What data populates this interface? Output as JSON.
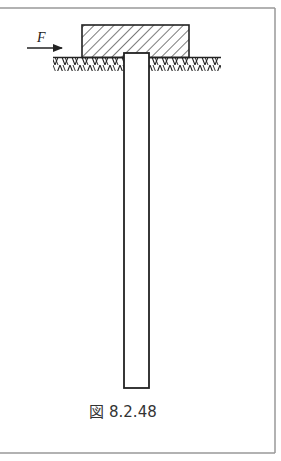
{
  "figure": {
    "caption": "図 8.2.48",
    "force_label": "F",
    "components": [
      {
        "name": "footing-block",
        "fill": "diagonal-hatch",
        "description": "Hatched rectangular cap block resting on ground"
      },
      {
        "name": "ground-surface",
        "fill": "zigzag-hatch",
        "description": "Ground line with soil hatching below"
      },
      {
        "name": "pile-column",
        "fill": "none",
        "description": "Long vertical pile embedded in the ground beneath the block"
      },
      {
        "name": "force-arrow",
        "direction": "right",
        "description": "Horizontal force F acting on the block"
      }
    ]
  },
  "colors": {
    "line": "#222222",
    "frame": "#999999",
    "background": "#ffffff"
  }
}
